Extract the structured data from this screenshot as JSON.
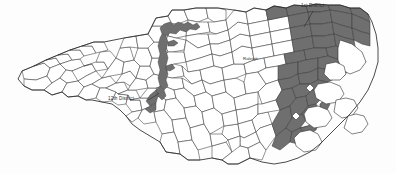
{
  "figure": {
    "width": 396,
    "height": 174,
    "background_color": "#fdfdfd"
  },
  "labels": {
    "district_1": "1st District",
    "district_12": "12th District",
    "raleigh": "Raleigh"
  },
  "colors": {
    "shaded_district_fill": "#6f6f6f",
    "county_fill": "#ffffff",
    "county_border": "#3b3b3b",
    "state_border": "#2a2a2a",
    "label_text": "#2b2b2b"
  },
  "map_data": {
    "type": "choropleth",
    "region": "North Carolina",
    "unit": "county",
    "highlighted_districts": [
      {
        "name": "1st District",
        "label": "1st District",
        "fill": "#6f6f6f",
        "location": "northeastern North Carolina",
        "leader_line": true
      },
      {
        "name": "12th District",
        "label": "12th District",
        "fill": "#6f6f6f",
        "location": "narrow corridor in central Piedmont North Carolina",
        "leader_line": true
      }
    ],
    "cities": [
      {
        "name": "Raleigh",
        "label": "Raleigh"
      }
    ],
    "legend": "none",
    "grid": false
  }
}
